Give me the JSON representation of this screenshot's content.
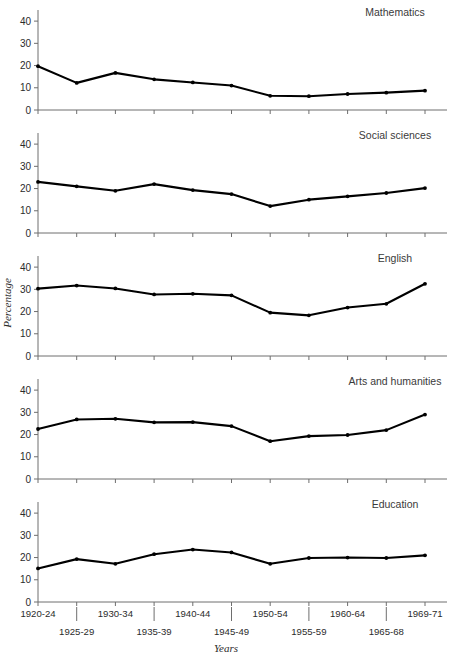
{
  "chart_data": {
    "type": "line",
    "title": "",
    "xlabel": "Years",
    "ylabel": "Percentage",
    "ylim": [
      0,
      45
    ],
    "yticks": [
      0,
      10,
      20,
      30,
      40
    ],
    "grid": false,
    "legend_position": "panel-title-top-right",
    "layout": "small-multiples-vertical",
    "panel_count": 5,
    "categories": [
      "1920-24",
      "1925-29",
      "1930-34",
      "1935-39",
      "1940-44",
      "1945-49",
      "1950-54",
      "1955-59",
      "1960-64",
      "1965-68",
      "1969-71"
    ],
    "xtick_rows": {
      "upper": [
        "1920-24",
        "1930-34",
        "1940-44",
        "1950-54",
        "1960-64",
        "1969-71"
      ],
      "lower": [
        "1925-29",
        "1935-39",
        "1945-49",
        "1955-59",
        "1965-68"
      ]
    },
    "series": [
      {
        "name": "Mathematics",
        "values": [
          19.7,
          12.2,
          16.7,
          13.8,
          12.4,
          11.0,
          6.4,
          6.2,
          7.2,
          7.8,
          8.7
        ]
      },
      {
        "name": "Social sciences",
        "values": [
          23.0,
          21.0,
          19.0,
          22.0,
          19.3,
          17.5,
          12.1,
          15.0,
          16.5,
          18.0,
          20.2
        ]
      },
      {
        "name": "English",
        "values": [
          30.3,
          31.7,
          30.4,
          27.7,
          28.0,
          27.3,
          19.5,
          18.3,
          21.8,
          23.5,
          25.8
        ]
      },
      {
        "name": "Arts and humanities",
        "values": [
          22.5,
          26.8,
          27.1,
          25.5,
          25.6,
          23.8,
          17.0,
          19.3,
          19.8,
          22.0,
          29.0
        ]
      },
      {
        "name": "Education",
        "values": [
          15.1,
          19.3,
          17.2,
          21.5,
          23.6,
          22.3,
          17.2,
          19.8,
          20.0,
          19.8,
          21.0
        ]
      }
    ],
    "english_final_point": 32.5,
    "colors": {
      "line": "#000000",
      "axis": "#6e6e6e",
      "text": "#2b2b2b",
      "background": "#ffffff"
    }
  }
}
